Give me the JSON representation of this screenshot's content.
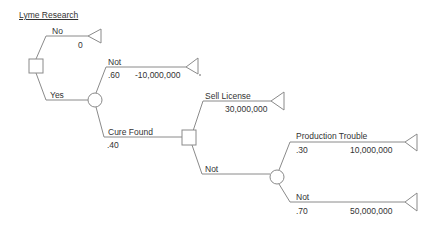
{
  "diagram": {
    "title": "Lyme Research",
    "type": "decision-tree",
    "colors": {
      "line": "#8a8a8a",
      "text": "#333333",
      "background": "#ffffff"
    },
    "nodes": [
      {
        "id": "d1",
        "kind": "decision",
        "shape": "square"
      },
      {
        "id": "c1",
        "kind": "chance",
        "shape": "circle"
      },
      {
        "id": "d2",
        "kind": "decision",
        "shape": "square"
      },
      {
        "id": "c2",
        "kind": "chance",
        "shape": "circle"
      }
    ],
    "branches": {
      "no": {
        "label": "No",
        "payoff": "0"
      },
      "yes": {
        "label": "Yes"
      },
      "not_cure": {
        "label": "Not",
        "probability": ".60",
        "payoff": "-10,000,000"
      },
      "cure_found": {
        "label": "Cure Found",
        "probability": ".40"
      },
      "sell_license": {
        "label": "Sell License",
        "payoff": "30,000,000"
      },
      "not_sell": {
        "label": "Not"
      },
      "prod_trouble": {
        "label": "Production Trouble",
        "probability": ".30",
        "payoff": "10,000,000"
      },
      "no_trouble": {
        "label": "Not",
        "probability": ".70",
        "payoff": "50,000,000"
      }
    }
  }
}
